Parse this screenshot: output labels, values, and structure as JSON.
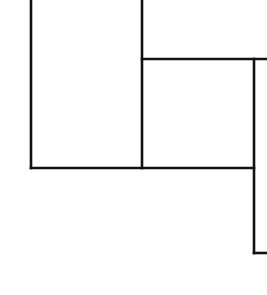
{
  "diagram": {
    "width": 267,
    "height": 295,
    "background": "#ffffff",
    "stroke_color": "#111111",
    "stroke_width": 2.6,
    "segments": [
      {
        "name": "left-vertical",
        "x1": 31,
        "y1": 0,
        "x2": 31,
        "y2": 168
      },
      {
        "name": "bottom-horizontal",
        "x1": 31,
        "y1": 168,
        "x2": 254,
        "y2": 168
      },
      {
        "name": "middle-vertical",
        "x1": 142,
        "y1": 0,
        "x2": 142,
        "y2": 168
      },
      {
        "name": "upper-horizontal",
        "x1": 142,
        "y1": 59,
        "x2": 267,
        "y2": 59
      },
      {
        "name": "right-vertical",
        "x1": 254,
        "y1": 59,
        "x2": 254,
        "y2": 253
      },
      {
        "name": "bottom-right-stub",
        "x1": 254,
        "y1": 253,
        "x2": 267,
        "y2": 253
      }
    ]
  }
}
